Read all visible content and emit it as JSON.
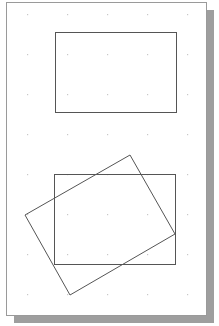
{
  "page": {
    "background": "#ffffff",
    "border_color": "#9a9a9a",
    "shadow_color": "#9e9e9e",
    "x": 6,
    "y": 2,
    "width": 200,
    "height": 313,
    "shadow_offset": 8
  },
  "grid": {
    "dot_color": "#c8c8c8",
    "xs": [
      27,
      67,
      107,
      147,
      187
    ],
    "ys": [
      14,
      54,
      94,
      134,
      174,
      214,
      254,
      294
    ]
  },
  "shapes": [
    {
      "name": "top-rectangle",
      "type": "rect",
      "x": 55,
      "y": 32,
      "width": 121,
      "height": 80,
      "stroke": "#555555"
    },
    {
      "name": "bottom-rectangle",
      "type": "rect",
      "x": 54,
      "y": 174,
      "width": 121,
      "height": 90,
      "stroke": "#555555"
    },
    {
      "name": "rotated-rectangle",
      "type": "polygon",
      "points": [
        [
          130,
          155
        ],
        [
          175,
          234
        ],
        [
          70,
          295
        ],
        [
          25,
          215
        ]
      ],
      "stroke": "#555555"
    }
  ]
}
